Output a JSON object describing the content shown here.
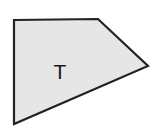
{
  "diagram": {
    "shape": {
      "type": "quadrilateral",
      "points": [
        [
          14,
          20
        ],
        [
          98,
          19
        ],
        [
          148,
          66
        ],
        [
          14,
          124
        ]
      ],
      "fill": "#e6e6e6",
      "stroke": "#222222",
      "stroke_width": 2.2
    },
    "label": {
      "text": "T",
      "x": 60,
      "y": 79
    }
  }
}
